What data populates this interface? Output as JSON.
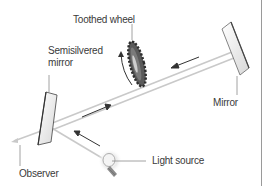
{
  "diagram": {
    "labels": {
      "toothed_wheel": "Toothed wheel",
      "semisilvered_mirror_line1": "Semisilvered",
      "semisilvered_mirror_line2": "mirror",
      "mirror": "Mirror",
      "observer": "Observer",
      "light_source": "Light source"
    },
    "colors": {
      "background": "#ffffff",
      "text": "#3a3a3a",
      "leader_line": "#8a8a8a",
      "beam": "#c8c8c8",
      "arrow": "#333333",
      "mirror_fill": "#eeeeee",
      "mirror_edge": "#555555",
      "wheel": "#444444",
      "bulb_glow": "#e8e8e8",
      "frame": "#9a9a9a"
    }
  }
}
